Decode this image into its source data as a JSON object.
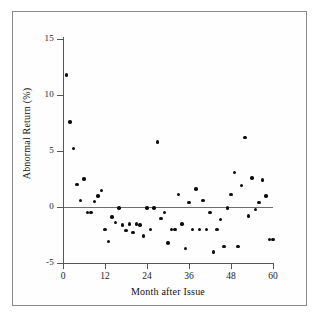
{
  "figure": {
    "background_color": "#ffffff",
    "frame_color": "#8a8a8a",
    "point_color": "#0d0d0d",
    "axis_color": "#555555",
    "zero_line_color": "#6e6e6e"
  },
  "chart_data": {
    "type": "scatter",
    "title": "",
    "xlabel": "Month after Issue",
    "ylabel": "Abnormal Return (%)",
    "xlim": [
      0,
      60
    ],
    "ylim": [
      -5,
      15
    ],
    "xticks": [
      0,
      12,
      24,
      36,
      48,
      60
    ],
    "xtick_labels": [
      "0",
      "12",
      "24",
      "36",
      "48",
      "60"
    ],
    "yticks": [
      -5,
      0,
      5,
      10,
      15
    ],
    "ytick_labels": [
      "-5",
      "0",
      "5",
      "10",
      "15"
    ],
    "grid": false,
    "legend": null,
    "reference_lines": [
      {
        "axis": "y",
        "value": 0,
        "style": "solid"
      }
    ],
    "x": [
      1,
      2,
      3,
      4,
      5,
      6,
      7,
      8,
      9,
      10,
      11,
      12,
      13,
      14,
      15,
      16,
      17,
      18,
      19,
      20,
      21,
      22,
      23,
      24,
      25,
      26,
      27,
      28,
      29,
      30,
      31,
      32,
      33,
      34,
      35,
      36,
      37,
      38,
      39,
      40,
      41,
      42,
      43,
      44,
      45,
      46,
      47,
      48,
      49,
      50,
      51,
      52,
      53,
      54,
      55,
      56,
      57,
      58,
      59,
      60
    ],
    "y": [
      11.8,
      7.6,
      5.2,
      2.0,
      0.6,
      2.5,
      -0.5,
      -0.5,
      0.5,
      1.0,
      1.5,
      -2.0,
      -3.1,
      -0.9,
      -1.4,
      -0.1,
      -1.6,
      -2.1,
      -1.5,
      -2.3,
      -1.5,
      -1.6,
      -2.6,
      -0.1,
      -2.0,
      -0.1,
      5.8,
      -1.0,
      -0.5,
      -3.2,
      -2.0,
      -2.0,
      1.1,
      -1.5,
      -3.7,
      0.4,
      -2.0,
      1.6,
      -2.0,
      0.6,
      -2.0,
      -0.5,
      -4.0,
      -2.0,
      -1.1,
      -3.5,
      -0.1,
      1.1,
      3.1,
      -3.5,
      1.9,
      6.2,
      -0.8,
      2.6,
      -0.2,
      0.4,
      2.4,
      1.0,
      -2.9,
      -2.9
    ],
    "n_points": 60,
    "marker": "circle",
    "marker_size": 3.4
  }
}
